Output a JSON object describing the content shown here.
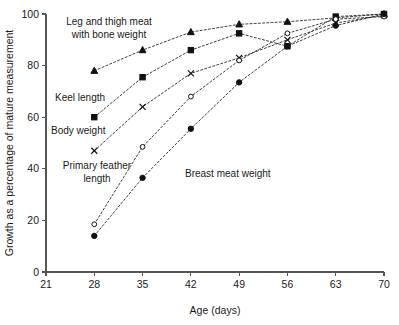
{
  "chart_data": {
    "type": "line",
    "title": "",
    "xlabel": "Age (days)",
    "ylabel": "Growth as a percentage of mature measurement",
    "xlim": [
      21,
      70
    ],
    "ylim": [
      0,
      100
    ],
    "grid": false,
    "legend_position": "inline-annotations",
    "x": [
      28,
      35,
      42,
      49,
      56,
      63,
      70
    ],
    "xticks": [
      "21",
      "28",
      "35",
      "42",
      "49",
      "56",
      "63",
      "70"
    ],
    "xtick_values": [
      21,
      28,
      35,
      42,
      49,
      56,
      63,
      70
    ],
    "yticks": [
      "0",
      "20",
      "40",
      "60",
      "80",
      "100"
    ],
    "ytick_values": [
      0,
      20,
      40,
      60,
      80,
      100
    ],
    "series": [
      {
        "name": "Leg and thigh meat with bone weight",
        "marker": "filled-triangle",
        "values": [
          78,
          86,
          93,
          96,
          97,
          98.5,
          100
        ]
      },
      {
        "name": "Keel length",
        "marker": "filled-square",
        "values": [
          60,
          75.5,
          86,
          92.5,
          87.5,
          99,
          100
        ]
      },
      {
        "name": "Body weight",
        "marker": "cross",
        "values": [
          47,
          64,
          77,
          83,
          90,
          96.5,
          99.5
        ]
      },
      {
        "name": "Primary feather length",
        "marker": "open-circle",
        "values": [
          18.5,
          48.5,
          68,
          82,
          92.5,
          98,
          99
        ]
      },
      {
        "name": "Breast meat weight",
        "marker": "filled-circle",
        "values": [
          14,
          36.5,
          55.5,
          73.5,
          87.5,
          95.5,
          100
        ]
      }
    ],
    "annotations": [
      {
        "id": "leg-and-thigh",
        "lines": [
          "Leg and thigh meat",
          "with bone weight"
        ],
        "x_px": 109,
        "y_px": 25,
        "align": "center"
      },
      {
        "id": "keel-length",
        "lines": [
          "Keel  length"
        ],
        "x_px": 55,
        "y_px": 101,
        "align": "start"
      },
      {
        "id": "body-weight",
        "lines": [
          "Body weight"
        ],
        "x_px": 51,
        "y_px": 134,
        "align": "start"
      },
      {
        "id": "primary-feather",
        "lines": [
          "Primary feather",
          "length"
        ],
        "x_px": 97,
        "y_px": 169,
        "align": "center"
      },
      {
        "id": "breast-meat",
        "lines": [
          "Breast meat weight"
        ],
        "x_px": 185,
        "y_px": 177,
        "align": "start"
      }
    ],
    "colors": {
      "marker": "#111111",
      "line": "#2b2b2b",
      "axis": "#555555",
      "text": "#1a1a1a",
      "background": "#ffffff"
    }
  }
}
